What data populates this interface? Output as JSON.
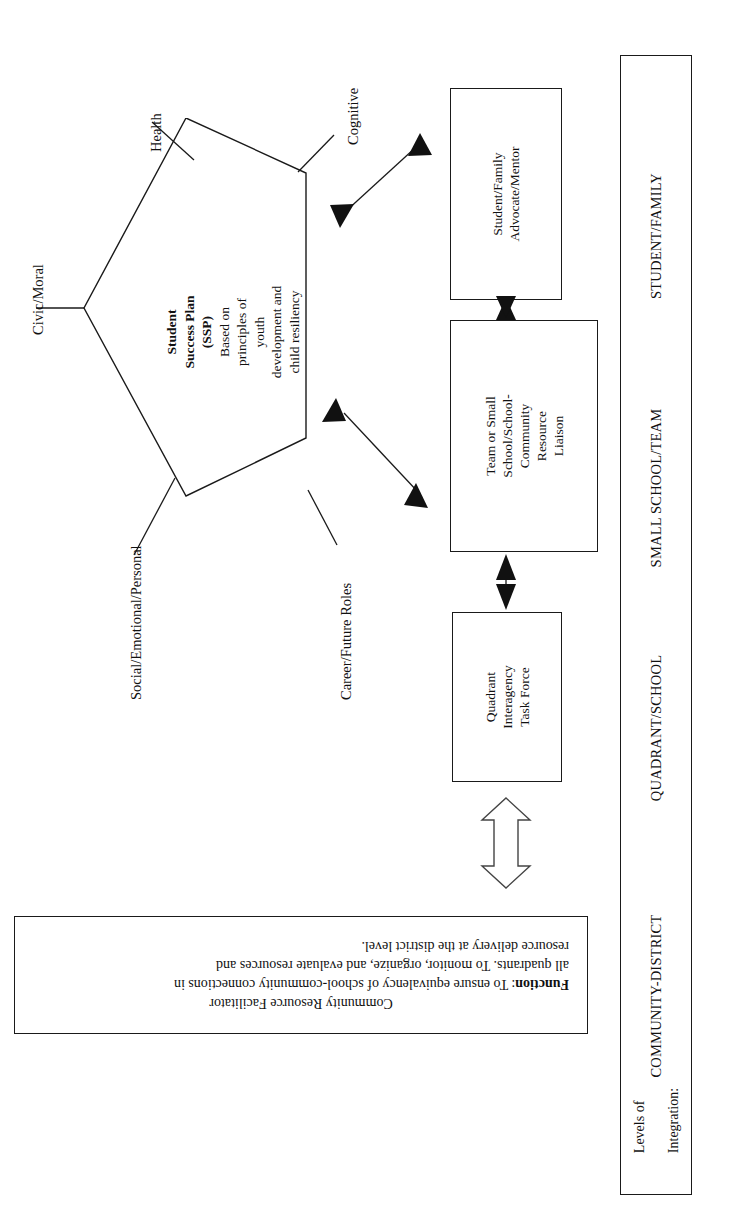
{
  "document": {
    "orientation": "rotated-90-ccw",
    "background_color": "#ffffff",
    "ink_color": "#1a1a1a"
  },
  "pentagon": {
    "title_line_1": "Student",
    "title_line_2": "Success Plan",
    "title_line_3": "(SSP)",
    "body_line_1": "Based on",
    "body_line_2": "principles of",
    "body_line_3": "youth",
    "body_line_4": "development and",
    "body_line_5": "child resiliency"
  },
  "spokes": [
    {
      "label": "Health"
    },
    {
      "label": "Cognitive"
    },
    {
      "label": "Civic/Moral"
    },
    {
      "label": "Social/Emotional/Personal"
    },
    {
      "label": "Career/Future Roles"
    }
  ],
  "boxes": [
    {
      "name": "student-family-advocate",
      "label": "Student/Family\nAdvocate/Mentor"
    },
    {
      "name": "team-small-school-liaison",
      "label": "Team or Small\nSchool/School-\nCommunity\nResource\nLiaison"
    },
    {
      "name": "quadrant-interagency-task-force",
      "label": "Quadrant\nInteragency\nTask Force"
    }
  ],
  "function_box": {
    "title": "Community Resource Facilitator",
    "function_label": "Function",
    "function_body": ": To ensure equivalency of school-community connections in all quadrants. To monitor, organize, and evaluate resources and resource delivery at the district level.",
    "line_1": "Community Resource Facilitator",
    "line_2_bold": "Function",
    "line_2_rest": ": To ensure equivalency of school-community connections in",
    "line_3": "all quadrants. To monitor, organize, and evaluate resources and",
    "line_4": "resource delivery at the district level."
  },
  "levels": {
    "caption_line_1": "Levels of",
    "caption_line_2": "Integration:",
    "items": [
      {
        "label": "COMMUNITY-DISTRICT"
      },
      {
        "label": "QUADRANT/SCHOOL"
      },
      {
        "label": "SMALL SCHOOL/TEAM"
      },
      {
        "label": "STUDENT/FAMILY"
      }
    ]
  },
  "connectors": [
    {
      "name": "pentagon-to-advocate",
      "style": "solid-double-arrow"
    },
    {
      "name": "pentagon-to-liaison",
      "style": "solid-double-arrow"
    },
    {
      "name": "advocate-to-liaison",
      "style": "solid-double-arrow"
    },
    {
      "name": "liaison-to-task-force",
      "style": "solid-double-arrow"
    },
    {
      "name": "task-force-to-facilitator",
      "style": "hollow-double-arrow"
    }
  ]
}
